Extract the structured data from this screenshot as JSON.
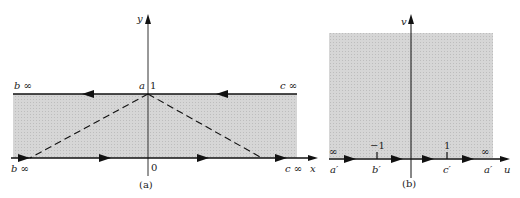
{
  "figure_a": {
    "caption": "(a)",
    "x_axis_label": "x",
    "y_axis_label": "y",
    "point_a_label": "a",
    "y_one_label": "1",
    "origin_label": "0",
    "top_left_label": "b ∞",
    "top_right_label": "c ∞",
    "bottom_left_label": "b ∞",
    "bottom_right_label": "c ∞",
    "region_color": "#d4d4d4"
  },
  "figure_b": {
    "caption": "(b)",
    "u_axis_label": "u",
    "v_axis_label": "v",
    "tick_minus_one": "−1",
    "tick_one": "1",
    "left_inf": "∞",
    "right_inf": "∞",
    "a_prime_left": "a′",
    "b_prime": "b′",
    "c_prime": "c′",
    "a_prime_right": "a′",
    "region_color": "#d4d4d4"
  }
}
